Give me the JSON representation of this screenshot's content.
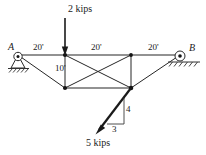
{
  "figure": {
    "type": "statics-truss-diagram",
    "canvas": {
      "width": 206,
      "height": 155
    },
    "colors": {
      "line": "#262626",
      "text": "#1a1a1a",
      "background": "#ffffff",
      "ground": "#333333"
    }
  },
  "supports": {
    "left": {
      "label": "A",
      "kind": "pin-support"
    },
    "right": {
      "label": "B",
      "kind": "roller-support"
    }
  },
  "dimensions": {
    "span_1": "20'",
    "span_2": "20'",
    "span_3": "20'",
    "height": "10'"
  },
  "loads": {
    "vertical": {
      "label": "2 kips",
      "magnitude": 2,
      "unit": "kips",
      "direction": "down"
    },
    "inclined": {
      "label": "5 kips",
      "magnitude": 5,
      "unit": "kips",
      "direction": "down-left"
    }
  },
  "slope_triangle": {
    "rise": "4",
    "run": "3"
  }
}
